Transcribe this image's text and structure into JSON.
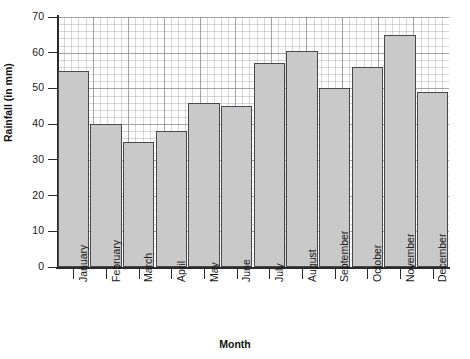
{
  "chart_data": {
    "type": "bar",
    "title": "",
    "xlabel": "Month",
    "ylabel": "Rainfall (in mm)",
    "categories": [
      "January",
      "February",
      "March",
      "April",
      "May",
      "June",
      "July",
      "August",
      "September",
      "October",
      "November",
      "December"
    ],
    "values": [
      55,
      40,
      35,
      38,
      46,
      45,
      57,
      60.5,
      50,
      56,
      65,
      49
    ],
    "ylim": [
      0,
      70
    ],
    "ytick_labels": [
      "0",
      "10",
      "20",
      "30",
      "40",
      "50",
      "60",
      "70"
    ],
    "ytick_values": [
      0,
      10,
      20,
      30,
      40,
      50,
      60,
      70
    ],
    "y_minor_step": 2,
    "grid": true,
    "grid_style": "graph-paper",
    "legend": "none",
    "bar_fill_color": "#c9c9c9",
    "bar_edge_color": "#4a4a4a",
    "axis_color": "#2a2a2a",
    "background_color": "#ffffff"
  }
}
